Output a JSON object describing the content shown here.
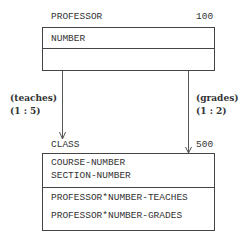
{
  "entities": {
    "professor": {
      "name": "PROFESSOR",
      "count": "100",
      "key_fields": [
        "NUMBER"
      ],
      "other_fields": []
    },
    "class": {
      "name": "CLASS",
      "count": "500",
      "key_fields": [
        "COURSE-NUMBER",
        "SECTION-NUMBER"
      ],
      "other_fields": [
        "PROFESSOR*NUMBER-TEACHES",
        "PROFESSOR*NUMBER-GRADES"
      ]
    }
  },
  "relationships": {
    "teaches": {
      "label": "(teaches)",
      "cardinality": "(1 : 5)"
    },
    "grades": {
      "label": "(grades)",
      "cardinality": "(1 : 2)"
    }
  }
}
